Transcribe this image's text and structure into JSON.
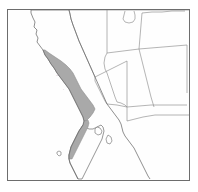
{
  "figure": {
    "type": "range-map",
    "region_title": "Western United States and Northwestern Mexico",
    "projection_note": "Pacific coast of California and Baja California",
    "alt_text": "Outline map of the southwestern United States and northwestern Mexico with a shaded gray band along the Pacific coast of California and northern Baja California."
  },
  "colors": {
    "frame_border": "#6d6d6d",
    "map_background": "#fefefe",
    "page_background": "#ffffff",
    "coastline_stroke": "#6a6a6a",
    "state_border_stroke": "#8d8d8d",
    "range_fill": "#a9a9a9",
    "range_stroke": "#8c8c8c",
    "label_text": "#555555"
  },
  "legend": {
    "range_label": "shaded distribution range",
    "has_visible_legend": false,
    "has_visible_scale_bar": false,
    "has_visible_compass": false
  },
  "labels": [
    {
      "id": "locality-mark-1",
      "text": "···",
      "x": 49,
      "y": 68
    },
    {
      "id": "locality-mark-2",
      "text": "·",
      "x": 56,
      "y": 82
    }
  ],
  "features": {
    "pacific_ocean": {
      "name": "Pacific Ocean",
      "rendered": true,
      "fill": "#fefefe"
    },
    "gulf_of_california": {
      "name": "Gulf of California",
      "rendered": true,
      "fill": "#fefefe"
    },
    "shaded_range": {
      "name": "Coastal shaded range",
      "fill": "#a9a9a9",
      "extent_description": "Narrow coastal band from northern California south through Baja California Norte"
    },
    "state_outlines": {
      "name": "State and international boundary lines",
      "count_visible": 12
    }
  },
  "geometry": {
    "coastline_path": "M 24 1 L 24 4 L 26 9 L 28 13 L 27 18 L 30 21 L 29 25 L 31 29 L 30 33 L 33 37 L 36 41 L 38 46 L 41 50 L 44 55 L 47 59 L 50 64 L 53 68 L 56 72 L 59 76 L 62 80 L 64 84 L 66 88 L 68 92 L 70 96 L 72 100 L 74 104 L 76 108 L 77 112 L 76 116 L 74 119 L 72 122 L 70 126 L 68 130 L 66 134 L 64 138 L 63 142 L 62 146 L 62 150 L 63 154 L 65 158 L 67 162 L 69 166 L 71 170",
    "california_eastern_border": "M 24 1 L 48 1 L 59 1 L 62 1 L 63 5 L 64 10 L 66 16 L 69 24 L 72 32 L 76 41 L 80 50 L 84 59 L 88 68 L 92 77 L 96 86 L 100 95",
    "range_band_path": "M 36 41 L 38 46 L 41 50 L 44 55 L 47 59 L 50 64 L 53 68 L 56 72 L 59 76 L 62 80 L 64 84 L 66 88 L 68 92 L 70 96 L 72 100 L 74 104 L 76 108 L 77 112 L 79 112 L 83 108 L 86 104 L 88 100 L 86 96 L 83 92 L 80 88 L 77 84 L 74 80 L 72 76 L 70 72 L 68 68 L 66 64 L 63 60 L 59 56 L 54 52 L 48 48 L 42 44 L 38 41 Z",
    "baja_peninsula": "M 76 116 L 74 119 L 72 122 L 70 126 L 68 130 L 66 134 L 64 138 L 63 142 L 62 146 L 62 150 L 63 154 L 65 158 L 67 162 L 69 166 L 71 170 L 75 170 L 77 166 L 79 162 L 81 158 L 83 154 L 85 150 L 87 146 L 89 142 L 91 138 L 93 134 L 95 130 L 96 126 L 97 122 L 96 118 L 94 116 L 90 118 L 86 120 L 82 120 L 78 118 Z",
    "mexico_mainland_coast": "M 100 95 L 103 99 L 106 103 L 109 107 L 112 111 L 114 115 L 115 119 L 116 123 L 118 127 L 121 131 L 124 135 L 127 139 L 129 143 L 131 147 L 133 151 L 135 155 L 137 159 L 139 163 L 141 167 L 143 170",
    "state_lines": [
      "M 62 1 L 62 1 L 63 5 L 64 10 L 66 16 L 69 24 L 72 32 L 76 41 L 80 50 L 84 59 L 88 68",
      "M 88 68 L 88 72 L 90 76 L 92 80 L 94 84 L 96 88 L 98 92 L 100 95",
      "M 62 1 L 100 1",
      "M 100 1 L 100 12 L 100 24 L 100 36 L 100 44",
      "M 88 68 L 96 64 L 104 60 L 112 56 L 120 52",
      "M 100 44 L 108 43 L 116 42 L 124 41 L 132 40",
      "M 132 40 L 133 28 L 134 16 L 135 4",
      "M 100 1 L 135 1 L 160 1 L 182 1",
      "M 135 4 L 145 3 L 155 3 L 165 2 L 178 2",
      "M 132 40 L 144 39 L 156 38 L 168 37 L 180 36",
      "M 120 52 L 120 68 L 120 84 L 120 98 L 120 112",
      "M 132 40 L 135 52 L 138 64 L 141 76 L 144 88 L 147 98",
      "M 180 36 L 180 52 L 180 68 L 180 84",
      "M 120 98 L 132 97 L 144 96 L 156 96 L 168 96 L 180 96",
      "M 100 95 L 110 96 L 120 98",
      "M 100 44 L 98 48 L 97 54 L 98 60 L 100 64 L 102 70 L 104 76 L 106 82 L 108 88 L 110 93",
      "M 120 112 L 128 110 L 136 108 L 148 106 L 160 106 L 172 106 L 182 106",
      "M 110 93 L 114 94 L 118 96 L 120 98"
    ],
    "idaho_wyoming_notch": "M 118 2 L 117 6 L 116 10 L 118 13 L 122 14 L 126 13 L 128 10 L 128 6 L 127 2",
    "gulf_islands": [
      "M 90 118 L 93 119 L 95 122 L 94 125 L 91 126 L 88 124 L 88 120 Z",
      "M 101 126 L 104 128 L 105 132 L 103 135 L 100 134 L 99 130 Z",
      "M 52 142 L 54 143 L 54 146 L 52 147 L 50 145 L 50 143 Z"
    ]
  },
  "viewbox": {
    "width": 183,
    "height": 172
  }
}
